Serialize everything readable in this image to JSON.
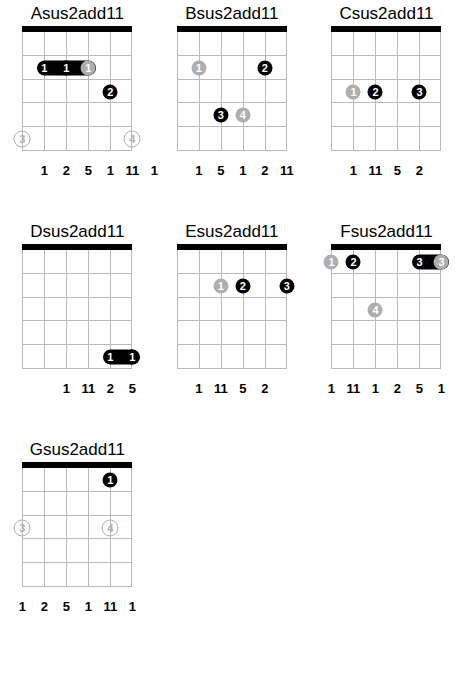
{
  "page": {
    "kind": "guitar-chord-chart",
    "string_count": 6,
    "fret_count": 5,
    "colors": {
      "marker_primary": "#000000",
      "marker_secondary": "#aeaeae",
      "grid_line": "#b9b9b9",
      "nut": "#000000",
      "text": "#000000",
      "background": "#ffffff"
    }
  },
  "chords": [
    {
      "name": "Asus2add11",
      "degrees": [
        "1",
        "2",
        "5",
        "1",
        "11",
        "1"
      ],
      "degree_strings": [
        1,
        2,
        3,
        4,
        5,
        6
      ],
      "markers": [
        {
          "finger": "1",
          "string": 1,
          "fret": 2,
          "color": "black",
          "barre": true,
          "barre_to": 3
        },
        {
          "finger": "1",
          "string": 2,
          "fret": 2,
          "color": "black"
        },
        {
          "finger": "1",
          "string": 3,
          "fret": 2,
          "color": "grey"
        },
        {
          "finger": "2",
          "string": 4,
          "fret": 3,
          "color": "black"
        },
        {
          "finger": "3",
          "string": 0,
          "fret": 5,
          "color": "open"
        },
        {
          "finger": "4",
          "string": 5,
          "fret": 5,
          "color": "open"
        }
      ]
    },
    {
      "name": "Bsus2add11",
      "degrees": [
        "1",
        "5",
        "1",
        "2",
        "11"
      ],
      "degree_strings": [
        1,
        2,
        3,
        4,
        5
      ],
      "markers": [
        {
          "finger": "1",
          "string": 1,
          "fret": 2,
          "color": "grey"
        },
        {
          "finger": "2",
          "string": 4,
          "fret": 2,
          "color": "black"
        },
        {
          "finger": "3",
          "string": 2,
          "fret": 4,
          "color": "black"
        },
        {
          "finger": "4",
          "string": 3,
          "fret": 4,
          "color": "grey"
        }
      ]
    },
    {
      "name": "Csus2add11",
      "degrees": [
        "1",
        "11",
        "5",
        "2"
      ],
      "degree_strings": [
        1,
        2,
        3,
        4
      ],
      "markers": [
        {
          "finger": "1",
          "string": 1,
          "fret": 3,
          "color": "grey"
        },
        {
          "finger": "2",
          "string": 2,
          "fret": 3,
          "color": "black"
        },
        {
          "finger": "3",
          "string": 4,
          "fret": 3,
          "color": "black"
        }
      ]
    },
    {
      "name": "Dsus2add11",
      "degrees": [
        "1",
        "11",
        "2",
        "5"
      ],
      "degree_strings": [
        2,
        3,
        4,
        5
      ],
      "markers": [
        {
          "finger": "1",
          "string": 4,
          "fret": 5,
          "color": "black",
          "barre": true,
          "barre_to": 5
        },
        {
          "finger": "1",
          "string": 5,
          "fret": 5,
          "color": "black"
        }
      ]
    },
    {
      "name": "Esus2add11",
      "degrees": [
        "1",
        "11",
        "5",
        "2"
      ],
      "degree_strings": [
        1,
        2,
        3,
        4
      ],
      "markers": [
        {
          "finger": "1",
          "string": 2,
          "fret": 2,
          "color": "grey"
        },
        {
          "finger": "2",
          "string": 3,
          "fret": 2,
          "color": "black"
        },
        {
          "finger": "3",
          "string": 5,
          "fret": 2,
          "color": "black"
        }
      ]
    },
    {
      "name": "Fsus2add11",
      "degrees": [
        "1",
        "11",
        "1",
        "2",
        "5",
        "1"
      ],
      "degree_strings": [
        0,
        1,
        2,
        3,
        4,
        5
      ],
      "markers": [
        {
          "finger": "1",
          "string": 0,
          "fret": 1,
          "color": "grey"
        },
        {
          "finger": "2",
          "string": 1,
          "fret": 1,
          "color": "black"
        },
        {
          "finger": "3",
          "string": 4,
          "fret": 1,
          "color": "black",
          "barre": true,
          "barre_to": 5
        },
        {
          "finger": "3",
          "string": 5,
          "fret": 1,
          "color": "grey"
        },
        {
          "finger": "4",
          "string": 2,
          "fret": 3,
          "color": "grey"
        }
      ]
    },
    {
      "name": "Gsus2add11",
      "degrees": [
        "1",
        "2",
        "5",
        "1",
        "11",
        "1"
      ],
      "degree_strings": [
        0,
        1,
        2,
        3,
        4,
        5
      ],
      "markers": [
        {
          "finger": "1",
          "string": 4,
          "fret": 1,
          "color": "black"
        },
        {
          "finger": "3",
          "string": 0,
          "fret": 3,
          "color": "open"
        },
        {
          "finger": "4",
          "string": 4,
          "fret": 3,
          "color": "open"
        }
      ]
    }
  ]
}
